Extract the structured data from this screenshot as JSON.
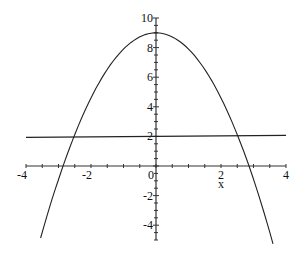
{
  "chart_data": {
    "type": "line",
    "title": "",
    "xlabel": "x",
    "ylabel": "",
    "xlim": [
      -4,
      4
    ],
    "ylim": [
      -5,
      10
    ],
    "grid": false,
    "x_ticks": [
      -4,
      -2,
      0,
      2,
      4
    ],
    "x_tick_labels": [
      "-4",
      "-2",
      "0",
      "2",
      "4"
    ],
    "y_ticks": [
      10,
      8,
      6,
      4,
      2,
      -2,
      -4
    ],
    "y_tick_labels": [
      "10",
      "8",
      "6",
      "4",
      "2",
      "-2",
      "-4"
    ],
    "series": [
      {
        "name": "parabola",
        "expression": "y = 9 - 1.1x^2 (approx.)",
        "x_range": [
          -3.55,
          3.6
        ],
        "vertex": [
          0,
          9
        ],
        "roots": [
          -2.86,
          2.86
        ]
      },
      {
        "name": "horizontal line",
        "expression": "y = 2",
        "x_range": [
          -4,
          4
        ]
      }
    ]
  }
}
